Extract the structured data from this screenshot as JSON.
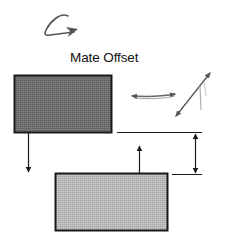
{
  "diagram": {
    "title": "Mate Offset",
    "icons": {
      "rotate": "curved-arrow-icon",
      "horizontal_move": "double-arrow-horizontal-icon",
      "diagonal_move": "double-arrow-diagonal-icon"
    },
    "parts": [
      {
        "name": "upper-part",
        "fill": "#6e6e6e",
        "stroke": "#1a1a1a",
        "x": 14,
        "y": 75,
        "w": 98,
        "h": 58
      },
      {
        "name": "lower-part",
        "fill": "#b8b8b8",
        "stroke": "#1a1a1a",
        "x": 55,
        "y": 173,
        "w": 113,
        "h": 58
      }
    ],
    "normals": [
      {
        "name": "upper-part-normal",
        "direction": "down",
        "x": 28,
        "y1": 133,
        "y2": 173
      },
      {
        "name": "lower-part-normal",
        "direction": "up",
        "x": 139,
        "y1": 173,
        "y2": 145
      }
    ],
    "dimension": {
      "label": "offset",
      "x": 195,
      "y_top": 132,
      "y_bottom": 174
    },
    "colors": {
      "line": "#1a1a1a",
      "sketch_arrow": "#555555",
      "faint": "#b0b0b0"
    }
  }
}
